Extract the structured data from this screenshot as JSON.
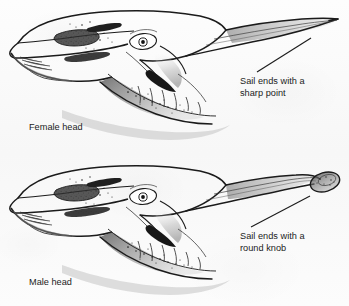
{
  "figure": {
    "background_color": "#fbfbfb",
    "ink_color": "#1b1b1b",
    "width": 349,
    "height": 306
  },
  "panels": [
    {
      "id": "female",
      "head_label": "Female head",
      "annotation": "Sail ends with a\nsharp point",
      "crest_ending": "sharp point"
    },
    {
      "id": "male",
      "head_label": "Male head",
      "annotation": "Sail ends with a\nround knob",
      "crest_ending": "round knob"
    }
  ],
  "icons": {
    "leader_line": "leader-line"
  }
}
